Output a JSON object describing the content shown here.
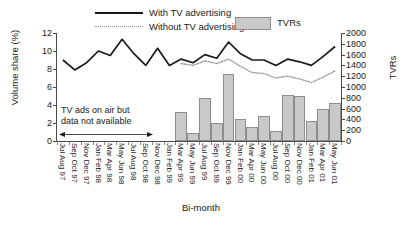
{
  "legend": {
    "with_tv": "With TV advertising",
    "without_tv": "Without TV advertising",
    "tvrs": "TVRs"
  },
  "annotation": {
    "line1": "TV ads on air but",
    "line2": "data not available"
  },
  "colors": {
    "line_with_tv": "#1a1a1a",
    "line_without_tv": "#9a9a9a",
    "bar_fill": "#c9c9c9",
    "bar_stroke": "#8d8d8d",
    "axis": "#4a4a4a"
  },
  "chart_data": {
    "type": "bar",
    "title": "",
    "xlabel": "Bi-month",
    "ylabel": "Volume share (%)",
    "y2label": "TVRs",
    "ylim": [
      0,
      12
    ],
    "y2lim": [
      0,
      2000
    ],
    "yticks": [
      0,
      2,
      4,
      6,
      8,
      10,
      12
    ],
    "y2ticks": [
      0,
      200,
      400,
      600,
      800,
      1000,
      1200,
      1400,
      1600,
      1800,
      2000
    ],
    "grid": false,
    "legend_position": "top",
    "categories": [
      "Jul Aug 97",
      "Sep Oct 97",
      "Nov Dec 97",
      "Jan Feb 98",
      "Mar Apr 98",
      "May Jun 98",
      "Jul Aug 98",
      "Sep Oct 98",
      "Nov Dec 98",
      "Jan Feb 99",
      "Mar Apr 99",
      "May Jun 99",
      "Jul Aug 99",
      "Sep Oct 99",
      "Nov Dec 99",
      "Jan Feb 00",
      "Mar Apr 00",
      "May Jun 00",
      "Jul Aug 00",
      "Sep Oct 00",
      "Nov Dec 00",
      "Jan Feb 01",
      "Mar Apr 01",
      "May Jun 01"
    ],
    "series": [
      {
        "name": "With TV advertising",
        "axis": "left",
        "style": "solid",
        "values": [
          9.0,
          7.9,
          8.7,
          10.0,
          9.5,
          11.3,
          9.7,
          8.4,
          10.3,
          8.4,
          9.1,
          8.7,
          9.6,
          9.2,
          11.0,
          9.7,
          9.0,
          9.0,
          8.4,
          9.1,
          8.8,
          8.4,
          9.4,
          10.5
        ]
      },
      {
        "name": "Without TV advertising",
        "axis": "left",
        "style": "dotted",
        "values": [
          null,
          null,
          null,
          null,
          null,
          null,
          null,
          null,
          null,
          null,
          8.6,
          8.4,
          8.9,
          8.6,
          9.1,
          8.3,
          7.6,
          7.5,
          7.0,
          7.2,
          6.9,
          6.5,
          7.1,
          7.8
        ]
      },
      {
        "name": "TVRs",
        "axis": "right",
        "style": "bar",
        "values": [
          0,
          0,
          0,
          0,
          0,
          0,
          0,
          0,
          0,
          0,
          540,
          150,
          790,
          335,
          1240,
          410,
          260,
          470,
          185,
          845,
          825,
          375,
          590,
          710
        ]
      }
    ]
  }
}
